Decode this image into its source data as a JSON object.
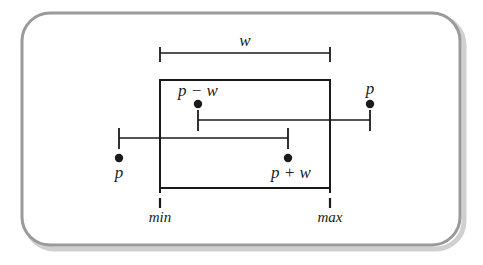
{
  "figure": {
    "kind": "interval-overlap-diagram",
    "background_color": "#ffffff",
    "frame": {
      "name": "rounded-frame",
      "stroke_color": "#9a9a9a",
      "shadow_color": "#c9c9c9",
      "x": 22,
      "y": 13,
      "width": 438,
      "height": 232,
      "radius": 28,
      "stroke_width": 3
    },
    "ink_color": "#1a1a1a",
    "rectangle": {
      "name": "min-max-box",
      "x": 160,
      "y": 80,
      "width": 170,
      "height": 108,
      "stroke_width": 2
    },
    "axis_ticks": {
      "min": {
        "label": "min",
        "x": 160,
        "tick_top": 198,
        "tick_bottom": 208,
        "label_y": 220
      },
      "max": {
        "label": "max",
        "x": 330,
        "tick_top": 198,
        "tick_bottom": 208,
        "label_y": 220
      }
    },
    "measure_bar": {
      "name": "w-span",
      "label": "w",
      "x1": 160,
      "x2": 330,
      "y": 53,
      "tick_length": 12,
      "tick_direction": "down",
      "label_x": 245,
      "label_y": 46
    },
    "bars": [
      {
        "name": "upper-interval",
        "x1": 198,
        "x2": 370,
        "y": 120,
        "tick_length": 18,
        "tick_direction": "up",
        "endpoints": [
          {
            "name": "p-minus-w-endpoint",
            "label": "p − w",
            "x": 198,
            "dot_y": 104,
            "label_x": 198,
            "label_y": 95,
            "label_anchor": "middle"
          },
          {
            "name": "p-endpoint-right",
            "label": "p",
            "x": 370,
            "dot_y": 104,
            "label_x": 370,
            "label_y": 93,
            "label_anchor": "middle"
          }
        ]
      },
      {
        "name": "lower-interval",
        "x1": 119,
        "x2": 288,
        "y": 138,
        "tick_length": 18,
        "tick_direction": "down",
        "endpoints": [
          {
            "name": "p-endpoint-left",
            "label": "p",
            "x": 119,
            "dot_y": 158,
            "label_x": 119,
            "label_y": 178,
            "label_anchor": "middle"
          },
          {
            "name": "p-plus-w-endpoint",
            "label": "p + w",
            "x": 288,
            "dot_y": 158,
            "label_x": 291,
            "label_y": 178,
            "label_anchor": "middle"
          }
        ]
      }
    ],
    "dot_radius": 4.2
  }
}
